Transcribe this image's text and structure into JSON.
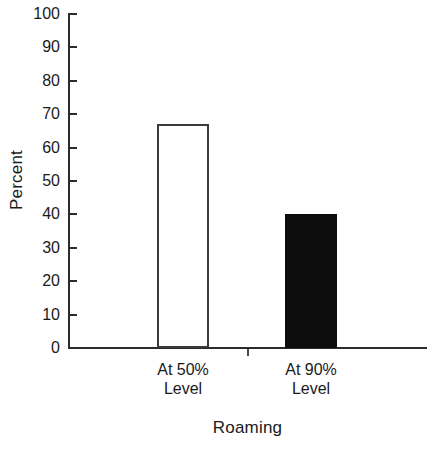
{
  "chart_data": {
    "type": "bar",
    "title": "",
    "subtitle": "",
    "categories": [
      "At 50%\nLevel",
      "At 90%\nLevel"
    ],
    "values": [
      67,
      40
    ],
    "xlabel": "Roaming",
    "ylabel": "Percent",
    "ylim": [
      0,
      100
    ],
    "ytick_values": [
      0,
      10,
      20,
      30,
      40,
      50,
      60,
      70,
      80,
      90,
      100
    ],
    "ytick_labels": [
      "0",
      "10",
      "20",
      "30",
      "40",
      "50",
      "60",
      "70",
      "80",
      "90",
      "100"
    ],
    "grid": false,
    "legend": null,
    "bar_styles": [
      {
        "fill": "#ffffff",
        "edge": "#3a3a3a",
        "name": "open-bar"
      },
      {
        "fill": "#0c0c0c",
        "edge": "#0c0c0c",
        "name": "filled-bar"
      }
    ],
    "annotations": []
  },
  "axes": {
    "y_title": "Percent",
    "x_title": "Roaming",
    "axis_color": "#2b2b2b",
    "background": "#ffffff"
  },
  "bars": [
    {
      "label": "At 50%\nLevel",
      "value": 67,
      "style": "open"
    },
    {
      "label": "At 90%\nLevel",
      "value": 40,
      "style": "filled"
    }
  ]
}
